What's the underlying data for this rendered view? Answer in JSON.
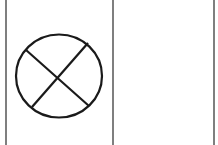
{
  "diagram": {
    "stroke_color": "#1a1a1a",
    "frame_color": "#555555",
    "background": "#ffffff",
    "panels": [
      {
        "id": "left",
        "contains": "crossed-circle-symbol"
      },
      {
        "id": "right",
        "contains": "empty"
      }
    ],
    "symbol": {
      "type": "crossed-circle",
      "center": [
        57,
        76
      ],
      "radius": 42
    }
  }
}
